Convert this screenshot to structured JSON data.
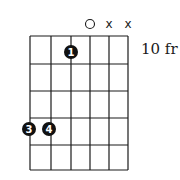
{
  "diagram": {
    "type": "guitar-chord-chart",
    "fret_label": "10 fr",
    "strings": 6,
    "frets_shown": 5,
    "string_markers": [
      {
        "string": 4,
        "type": "open",
        "symbol": "○"
      },
      {
        "string": 5,
        "type": "muted",
        "symbol": "x"
      },
      {
        "string": 6,
        "type": "muted",
        "symbol": "x"
      }
    ],
    "fingers": [
      {
        "finger": "1",
        "string": 3,
        "fret": 1
      },
      {
        "finger": "3",
        "string": 1,
        "fret": 4
      },
      {
        "finger": "4",
        "string": 2,
        "fret": 4
      }
    ],
    "colors": {
      "line": "#1a1a1a",
      "dot": "#111111",
      "dot_text": "#ffffff",
      "background": "#ffffff"
    }
  }
}
